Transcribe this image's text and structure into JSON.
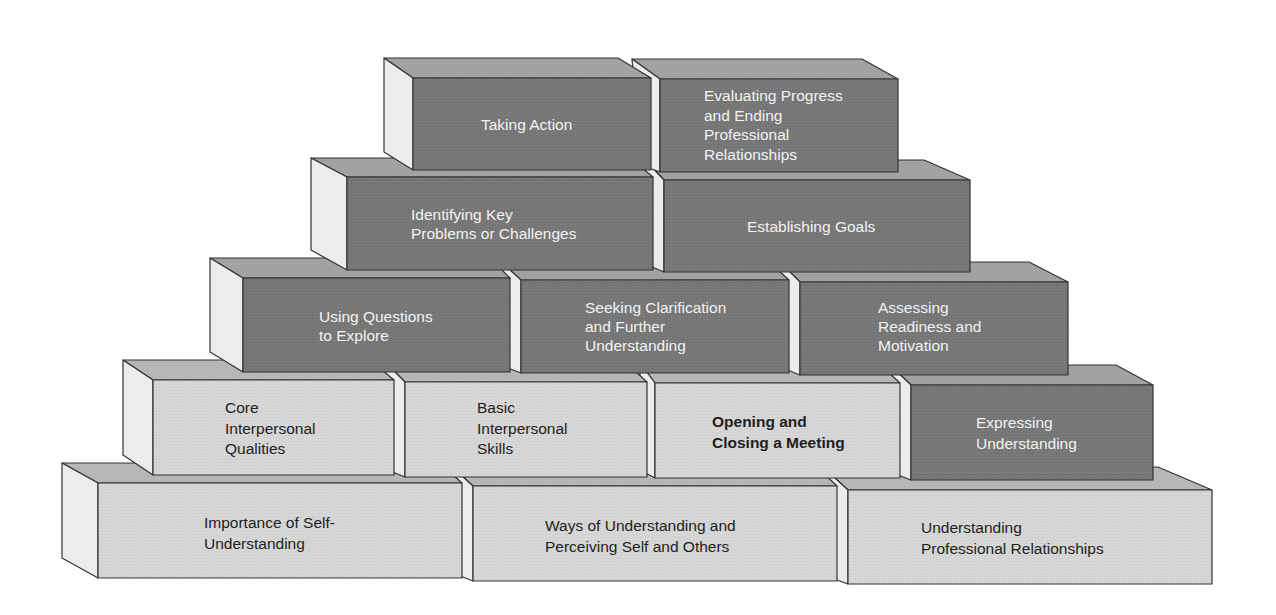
{
  "diagram": {
    "colors": {
      "dark_front": "#7a7a7a",
      "dark_top": "#a3a3a3",
      "light_front": "#d6d6d6",
      "light_top": "#b8b8b8",
      "side": "#ededed",
      "outline": "#333333"
    },
    "rows": [
      {
        "row": 1,
        "blocks": [
          {
            "id": "taking-action",
            "label": "Taking Action",
            "shade": "dark"
          },
          {
            "id": "evaluating-progress",
            "label": "Evaluating Progress\nand Ending\nProfessional\nRelationships",
            "shade": "dark"
          }
        ]
      },
      {
        "row": 2,
        "blocks": [
          {
            "id": "identifying-key-problems",
            "label": "Identifying Key\nProblems or Challenges",
            "shade": "dark"
          },
          {
            "id": "establishing-goals",
            "label": "Establishing Goals",
            "shade": "dark"
          }
        ]
      },
      {
        "row": 3,
        "blocks": [
          {
            "id": "using-questions",
            "label": "Using Questions\nto Explore",
            "shade": "dark"
          },
          {
            "id": "seeking-clarification",
            "label": "Seeking Clarification\nand Further\nUnderstanding",
            "shade": "dark"
          },
          {
            "id": "assessing-readiness",
            "label": "Assessing\nReadiness and\nMotivation",
            "shade": "dark"
          }
        ]
      },
      {
        "row": 4,
        "blocks": [
          {
            "id": "core-interpersonal-qualities",
            "label": "Core\nInterpersonal\nQualities",
            "shade": "light"
          },
          {
            "id": "basic-interpersonal-skills",
            "label": "Basic\nInterpersonal\nSkills",
            "shade": "light"
          },
          {
            "id": "opening-closing-meeting",
            "label": "Opening and\nClosing a Meeting",
            "shade": "light",
            "bold": true
          },
          {
            "id": "expressing-understanding",
            "label": "Expressing\nUnderstanding",
            "shade": "dark"
          }
        ]
      },
      {
        "row": 5,
        "blocks": [
          {
            "id": "importance-self-understanding",
            "label": "Importance of Self-\nUnderstanding",
            "shade": "light"
          },
          {
            "id": "ways-of-understanding",
            "label": "Ways of Understanding and\nPerceiving Self and Others",
            "shade": "light"
          },
          {
            "id": "understanding-professional-relationships",
            "label": "Understanding\nProfessional Relationships",
            "shade": "light"
          }
        ]
      }
    ]
  }
}
